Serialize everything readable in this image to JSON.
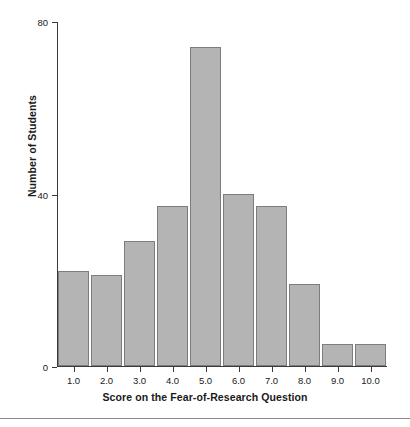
{
  "chart_data": {
    "type": "bar",
    "title": "",
    "xlabel": "Score on the Fear-of-Research Question",
    "ylabel": "Number of Students",
    "categories": [
      "1.0",
      "2.0",
      "3.0",
      "4.0",
      "5.0",
      "6.0",
      "7.0",
      "8.0",
      "9.0",
      "10.0"
    ],
    "values": [
      22,
      21,
      29,
      37,
      74,
      40,
      37,
      19,
      5,
      5
    ],
    "xlim": [
      0.5,
      10.5
    ],
    "ylim": [
      0,
      80
    ],
    "yticks": [
      "0",
      "40",
      "80"
    ],
    "ytick_values": [
      0,
      40,
      80
    ],
    "grid": false,
    "legend": null,
    "bar_fill_color": "#b4b4b4",
    "bar_edge_color": "#7d7d7d",
    "axis_color": "#3a3a3a"
  },
  "figure": {
    "background_color": "#ffffff",
    "bottom_rule_color": "#8a8a8a"
  }
}
